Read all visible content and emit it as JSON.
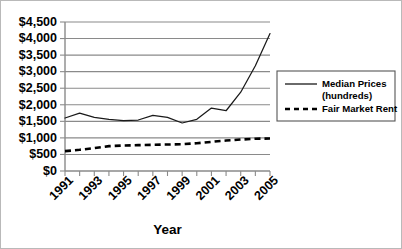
{
  "chart_data": {
    "type": "line",
    "title": "",
    "xlabel": "Year",
    "ylabel": "",
    "grid": true,
    "legend_position": "right",
    "xlim": [
      1991,
      2005
    ],
    "ylim": [
      0,
      4500
    ],
    "ytick_step": 500,
    "x": [
      1991,
      1992,
      1993,
      1994,
      1995,
      1996,
      1997,
      1998,
      1999,
      2000,
      2001,
      2002,
      2003,
      2004,
      2005
    ],
    "xtick_labels": [
      "1991",
      "",
      "1993",
      "",
      "1995",
      "",
      "1997",
      "",
      "1999",
      "",
      "2001",
      "",
      "2003",
      "",
      "2005"
    ],
    "ytick_labels": [
      "$0",
      "$500",
      "$1,000",
      "$1,500",
      "$2,000",
      "$2,500",
      "$3,000",
      "$3,500",
      "$4,000",
      "$4,500"
    ],
    "ytick_values": [
      0,
      500,
      1000,
      1500,
      2000,
      2500,
      3000,
      3500,
      4000,
      4500
    ],
    "series": [
      {
        "name": "Median Prices (hundreds)",
        "style": "solid",
        "color": "#1a1a1a",
        "values": [
          1600,
          1750,
          1620,
          1560,
          1520,
          1540,
          1680,
          1620,
          1450,
          1560,
          1900,
          1820,
          2380,
          3180,
          4150
        ]
      },
      {
        "name": "Fair Market Rent",
        "style": "dashed",
        "color": "#000000",
        "values": [
          600,
          640,
          690,
          750,
          770,
          780,
          790,
          800,
          810,
          840,
          880,
          920,
          950,
          975,
          980
        ]
      }
    ]
  },
  "legend": {
    "entries": [
      {
        "label_line1": "Median Prices",
        "label_line2": "(hundreds)",
        "style": "solid"
      },
      {
        "label_line1": "Fair Market Rent",
        "label_line2": "",
        "style": "dashed"
      }
    ]
  },
  "axis_title": {
    "x": "Year"
  }
}
